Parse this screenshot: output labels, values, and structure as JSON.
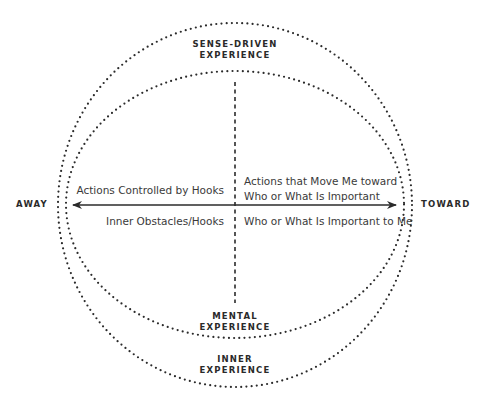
{
  "diagram": {
    "type": "matrix-circles",
    "colors": {
      "ink": "#2b2b2b",
      "background": "#ffffff"
    },
    "circles": {
      "outer": {
        "label_line1": "SENSE-DRIVEN",
        "label_line2": "EXPERIENCE"
      },
      "inner": {
        "label_line1": "MENTAL",
        "label_line2": "EXPERIENCE"
      },
      "bottom": {
        "label_line1": "INNER",
        "label_line2": "EXPERIENCE"
      }
    },
    "axis": {
      "left_label": "AWAY",
      "right_label": "TOWARD"
    },
    "quadrants": {
      "top_left": "Actions Controlled by Hooks",
      "top_right_line1": "Actions that Move Me toward",
      "top_right_line2": "Who or What Is Important",
      "bottom_left": "Inner Obstacles/Hooks",
      "bottom_right": "Who or What Is Important to Me"
    }
  }
}
